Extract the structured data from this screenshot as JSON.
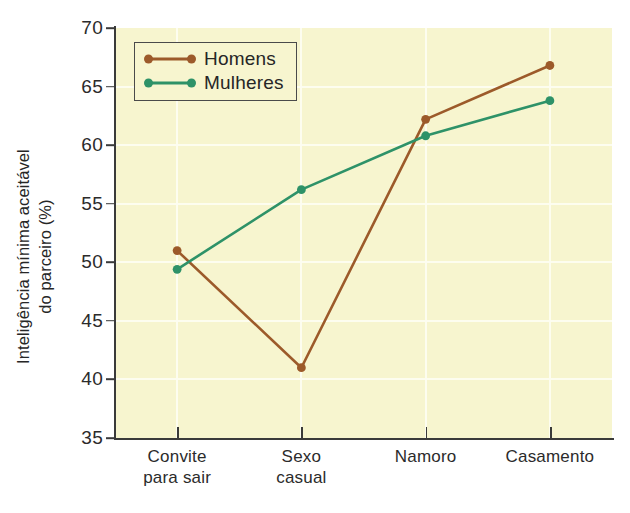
{
  "chart_data": {
    "type": "line",
    "title": "",
    "xlabel": "",
    "ylabel_lines": [
      "Inteligência mínima aceitável",
      "do parceiro (%)"
    ],
    "ylabel": "Inteligência mínima aceitável do parceiro (%)",
    "categories": [
      "Convite\npara sair",
      "Sexo\ncasual",
      "Namoro",
      "Casamento"
    ],
    "category_labels_flat": [
      "Convite para sair",
      "Sexo casual",
      "Namoro",
      "Casamento"
    ],
    "series": [
      {
        "name": "Homens",
        "color": "#9c5a2a",
        "values": [
          51.0,
          41.0,
          62.2,
          66.8
        ]
      },
      {
        "name": "Mulheres",
        "color": "#2e9268",
        "values": [
          49.4,
          56.2,
          60.8,
          63.8
        ]
      }
    ],
    "ylim": [
      35,
      70
    ],
    "yticks": [
      70,
      65,
      60,
      55,
      50,
      45,
      40,
      35
    ],
    "ytick_labels": [
      "70",
      "65",
      "60",
      "55",
      "50",
      "45",
      "40",
      "35"
    ],
    "grid": true,
    "grid_color": "#fdfdf0",
    "plot_background": "#f7f5cf",
    "legend_position": "upper left",
    "legend_entries": [
      "Homens",
      "Mulheres"
    ]
  }
}
